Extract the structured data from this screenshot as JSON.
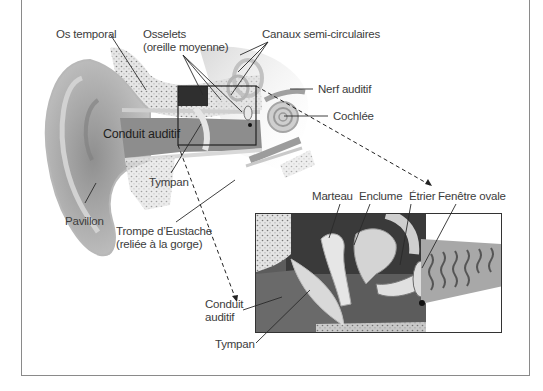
{
  "diagram": {
    "type": "ear-anatomy",
    "language": "fr",
    "main_labels": {
      "os_temporal": "Os temporal",
      "osselets_line1": "Osselets",
      "osselets_line2": "(oreille moyenne)",
      "canaux": "Canaux semi-circulaires",
      "nerf": "Nerf auditif",
      "cochlee": "Cochlée",
      "conduit": "Conduit auditif",
      "tympan": "Tympan",
      "pavillon": "Pavillon",
      "trompe_line1": "Trompe d’Eustache",
      "trompe_line2": "(reliée à la gorge)"
    },
    "inset_labels": {
      "marteau": "Marteau",
      "enclume": "Enclume",
      "etrier": "Étrier",
      "fenetre": "Fenêtre ovale",
      "conduit_line1": "Conduit",
      "conduit_line2": "auditif",
      "tympan": "Tympan"
    },
    "colors": {
      "frame": "#8a8a8a",
      "leader": "#2a2a2a",
      "skin": "#a9a9a9",
      "bone": "#d8d8d8"
    }
  }
}
